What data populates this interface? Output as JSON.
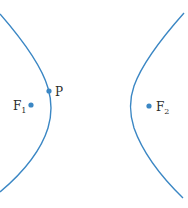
{
  "diagram": {
    "type": "hyperbola",
    "colors": {
      "curve": "#3b87c4",
      "point": "#3b87c4",
      "text": "#2b2b2b"
    },
    "points": {
      "P": {
        "label": "P"
      },
      "F1": {
        "label": "F",
        "subscript": "1"
      },
      "F2": {
        "label": "F",
        "subscript": "2"
      }
    }
  }
}
